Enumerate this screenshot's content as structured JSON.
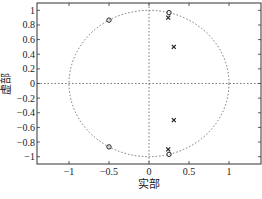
{
  "chart_data": {
    "type": "scatter",
    "title": "",
    "xlabel": "实部",
    "ylabel": "虚部",
    "xlim": [
      -1.4,
      1.4
    ],
    "ylim": [
      -1.1,
      1.1
    ],
    "xticks": [
      -1,
      -0.5,
      0,
      0.5,
      1
    ],
    "xtick_labels": [
      "−1",
      "−0.5",
      "0",
      "0.5",
      "1"
    ],
    "yticks": [
      1,
      0.8,
      0.6,
      0.4,
      0.2,
      0,
      -0.2,
      -0.4,
      -0.6,
      -0.8,
      -1
    ],
    "ytick_labels": [
      "1",
      "0.8",
      "0.6",
      "0.4",
      "0.2",
      "0",
      "−0.2",
      "−0.4",
      "−0.6",
      "−0.8",
      "−1"
    ],
    "grid": false,
    "unit_circle": true,
    "series": [
      {
        "name": "zeros",
        "marker": "o",
        "points": [
          {
            "x": -0.5,
            "y": 0.866
          },
          {
            "x": -0.5,
            "y": -0.866
          },
          {
            "x": 0.25,
            "y": 0.968
          },
          {
            "x": 0.25,
            "y": -0.968
          }
        ]
      },
      {
        "name": "poles",
        "marker": "x",
        "points": [
          {
            "x": 0.24,
            "y": 0.9
          },
          {
            "x": 0.24,
            "y": -0.9
          },
          {
            "x": 0.31,
            "y": 0.5
          },
          {
            "x": 0.31,
            "y": -0.5
          }
        ]
      }
    ]
  },
  "colors": {
    "axes": "#333333",
    "markers": "#222222",
    "circle": "#555555"
  }
}
